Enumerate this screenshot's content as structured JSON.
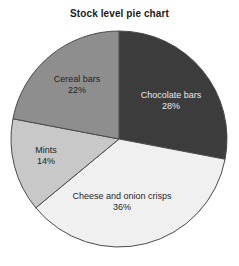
{
  "chart_data": {
    "type": "pie",
    "title": "Stock level pie chart",
    "xlabel": "",
    "ylabel": "",
    "categories": [
      "Chocolate bars",
      "Cheese and onion crisps",
      "Mints",
      "Cereal bars"
    ],
    "values": [
      28,
      36,
      14,
      22
    ],
    "value_unit": "%",
    "value_labels": [
      "28%",
      "36%",
      "14%",
      "22%"
    ],
    "start_angle_deg": 0,
    "direction": "clockwise",
    "legend": "none",
    "grid": false,
    "slices": [
      {
        "label": "Chocolate bars",
        "value": 28,
        "value_label": "28%",
        "color": "#3c3c3c",
        "label_text_color": "#e8e8e8",
        "start_angle_deg": 0,
        "end_angle_deg": 100.8
      },
      {
        "label": "Cheese and onion crisps",
        "value": 36,
        "value_label": "36%",
        "color": "#f0f0f0",
        "label_text_color": "#1f1f1f",
        "start_angle_deg": 100.8,
        "end_angle_deg": 230.4
      },
      {
        "label": "Mints",
        "value": 14,
        "value_label": "14%",
        "color": "#c8c8c8",
        "label_text_color": "#1f1f1f",
        "start_angle_deg": 230.4,
        "end_angle_deg": 280.8
      },
      {
        "label": "Cereal bars",
        "value": 22,
        "value_label": "22%",
        "color": "#8e8e8e",
        "label_text_color": "#1f1f1f",
        "start_angle_deg": 280.8,
        "end_angle_deg": 360
      }
    ],
    "geometry": {
      "center_x": 119,
      "center_y": 139,
      "radius": 108
    },
    "outline_color": "#4a4a4a",
    "background_color": "#ffffff"
  }
}
